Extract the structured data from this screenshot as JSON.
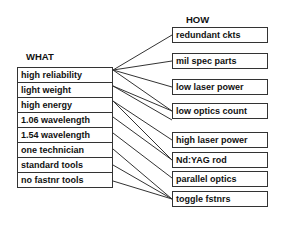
{
  "headings": {
    "what": "WHAT",
    "how": "HOW"
  },
  "what": [
    "high reliability",
    "light weight",
    "high energy",
    "1.06 wavelength",
    "1.54 wavelength",
    "one technician",
    "standard tools",
    "no fastnr tools"
  ],
  "how": [
    "redundant ckts",
    "mil spec parts",
    "low laser power",
    "low optics count",
    "aluminum case",
    "high laser power",
    "Nd:YAG rod",
    "parallel optics",
    "toggle fstnrs"
  ],
  "connections": [
    [
      "high reliability",
      "redundant ckts"
    ],
    [
      "high reliability",
      "mil spec parts"
    ],
    [
      "high reliability",
      "low laser power"
    ],
    [
      "high reliability",
      "low optics count"
    ],
    [
      "light weight",
      "low optics count"
    ],
    [
      "light weight",
      "aluminum case"
    ],
    [
      "high energy",
      "high laser power"
    ],
    [
      "high energy",
      "Nd:YAG rod"
    ],
    [
      "1.06 wavelength",
      "Nd:YAG rod"
    ],
    [
      "1.54 wavelength",
      "parallel optics"
    ],
    [
      "one technician",
      "toggle fstnrs"
    ],
    [
      "standard tools",
      "toggle fstnrs"
    ],
    [
      "no fastnr tools",
      "toggle fstnrs"
    ]
  ]
}
